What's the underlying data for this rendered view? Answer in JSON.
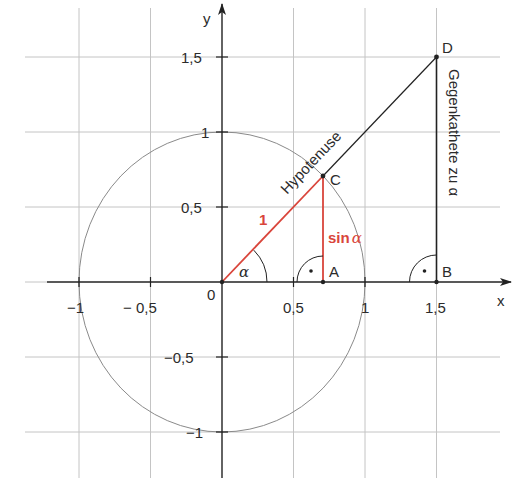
{
  "diagram": {
    "type": "unit-circle-sine-definition",
    "angle_deg": 45,
    "colors": {
      "grid": "#bdbdbd",
      "axis": "#222222",
      "circle": "#8a8a8a",
      "red": "#d9453b",
      "black": "#222222"
    },
    "axes": {
      "x_label": "x",
      "y_label": "y",
      "x_ticks": [
        {
          "value": -1,
          "label": "−1"
        },
        {
          "value": -0.5,
          "label": "− 0,5"
        },
        {
          "value": 0.5,
          "label": "0,5"
        },
        {
          "value": 1,
          "label": "1"
        },
        {
          "value": 1.5,
          "label": "1,5"
        }
      ],
      "y_ticks": [
        {
          "value": 1.5,
          "label": "1,5"
        },
        {
          "value": 1,
          "label": "1"
        },
        {
          "value": 0.5,
          "label": "0,5"
        },
        {
          "value": -0.5,
          "label": "−0,5"
        },
        {
          "value": -1,
          "label": "−1"
        }
      ],
      "origin_label": "0"
    },
    "points": {
      "A": {
        "label": "A",
        "x": 0.707,
        "y": 0
      },
      "B": {
        "label": "B",
        "x": 1.5,
        "y": 0
      },
      "C": {
        "label": "C",
        "x": 0.707,
        "y": 0.707
      },
      "D": {
        "label": "D",
        "x": 1.5,
        "y": 1.5
      }
    },
    "labels": {
      "radius": "1",
      "sin_word": "sin",
      "alpha": "α",
      "angle_alpha": "α",
      "hypotenuse": "Hypotenuse",
      "opposite_side": "Gegenkathete zu α",
      "right_angle_dot": "•"
    }
  }
}
